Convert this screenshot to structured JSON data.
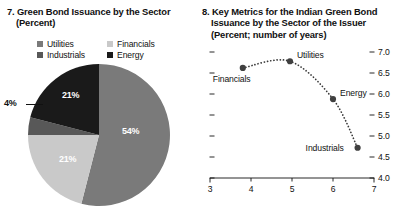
{
  "panel_left": {
    "title_line1": "7. Green Bond Issuance by the Sector",
    "title_line2": "(Percent)",
    "legend": [
      {
        "label": "Utilities",
        "color": "#7a7a7a"
      },
      {
        "label": "Financials",
        "color": "#c9c9c9"
      },
      {
        "label": "Industrials",
        "color": "#585858"
      },
      {
        "label": "Energy",
        "color": "#1a1a1a"
      }
    ],
    "labels": {
      "utilities": "54%",
      "financials": "21%",
      "industrials": "4%",
      "energy": "21%"
    }
  },
  "panel_right": {
    "title_line1": "8. Key Metrics for the Indian Green Bond",
    "title_line2": "Issuance by the Sector of the Issuer",
    "title_line3": "(Percent; number of years)"
  },
  "chart_data": [
    {
      "type": "pie",
      "title": "7. Green Bond Issuance by the Sector",
      "subtitle": "(Percent)",
      "categories": [
        "Utilities",
        "Financials",
        "Industrials",
        "Energy"
      ],
      "values": [
        54,
        21,
        4,
        21
      ],
      "labels": [
        "54%",
        "21%",
        "4%",
        "21%"
      ],
      "colors": [
        "#7a7a7a",
        "#c9c9c9",
        "#585858",
        "#1a1a1a"
      ],
      "start_angle_deg": 0,
      "direction": "clockwise",
      "legend_position": "top"
    },
    {
      "type": "scatter",
      "title": "8. Key Metrics for the Indian Green Bond Issuance by the Sector of the Issuer",
      "subtitle": "(Percent; number of years)",
      "xlabel": "",
      "ylabel": "",
      "xlim": [
        3,
        7
      ],
      "ylim": [
        4.0,
        7.0
      ],
      "xticks": [
        3,
        4,
        5,
        6,
        7
      ],
      "yticks": [
        4.0,
        4.5,
        5.0,
        5.5,
        6.0,
        6.5,
        7.0
      ],
      "ytick_labels": [
        "4.0",
        "4.5",
        "5.0",
        "5.5",
        "6.0",
        "6.5",
        "7.0"
      ],
      "xtick_labels": [
        "3",
        "4",
        "5",
        "6",
        "7"
      ],
      "grid": false,
      "y_axis_side": "right",
      "connector": "dotted-curve",
      "points": [
        {
          "name": "Financials",
          "x": 3.8,
          "y": 6.62,
          "label_pos": "below-left"
        },
        {
          "name": "Utilities",
          "x": 4.95,
          "y": 6.78,
          "label_pos": "right"
        },
        {
          "name": "Energy",
          "x": 6.0,
          "y": 5.88,
          "label_pos": "right"
        },
        {
          "name": "Industrials",
          "x": 6.6,
          "y": 4.72,
          "label_pos": "left"
        }
      ]
    }
  ]
}
